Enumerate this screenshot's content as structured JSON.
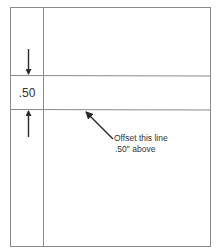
{
  "diagram": {
    "offset_label": ".50",
    "callout": {
      "line1": "Offset this line",
      "line2": ".50\" above"
    }
  },
  "colors": {
    "line": "#8a8a8a",
    "arrow": "#2a2a2a",
    "text": "#333333"
  }
}
